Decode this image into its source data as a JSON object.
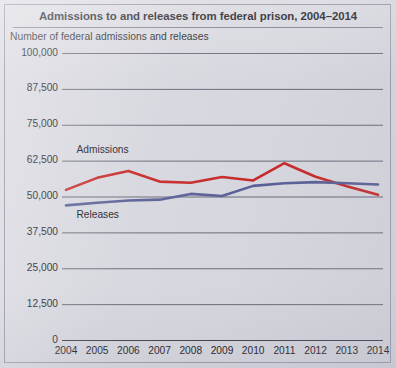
{
  "figure": {
    "title": "Admissions to and releases from federal prison, 2004–2014",
    "axis_title": "Number of federal admissions and releases",
    "background_color": "#d6d6de",
    "border_color": "#9a9aaa"
  },
  "chart_data": {
    "type": "line",
    "title": "Admissions to and releases from federal prison, 2004–2014",
    "subtitle": "Number of federal admissions and releases",
    "xlabel": "",
    "ylabel": "Number of federal admissions and releases",
    "categories": [
      "2004",
      "2005",
      "2006",
      "2007",
      "2008",
      "2009",
      "2010",
      "2011",
      "2012",
      "2013",
      "2014"
    ],
    "x": [
      2004,
      2005,
      2006,
      2007,
      2008,
      2009,
      2010,
      2011,
      2012,
      2013,
      2014
    ],
    "ylim": [
      0,
      100000
    ],
    "yticks": [
      0,
      12500,
      25000,
      37500,
      50000,
      62500,
      75000,
      87500,
      100000
    ],
    "ytick_labels": [
      "0",
      "12,500",
      "25,000",
      "37,500",
      "50,000",
      "62,500",
      "75,000",
      "87,500",
      "100,000"
    ],
    "grid": true,
    "grid_axis": "y",
    "legend": "inline-labels",
    "series": [
      {
        "name": "Admissions",
        "color": "#c62a28",
        "values": [
          52300,
          56500,
          58900,
          55200,
          54800,
          56800,
          55600,
          61600,
          56900,
          53600,
          50600
        ]
      },
      {
        "name": "Releases",
        "color": "#5a5f96",
        "values": [
          46900,
          47800,
          48600,
          48900,
          50900,
          50200,
          53700,
          54600,
          55000,
          54600,
          54200
        ]
      }
    ],
    "annotations": [
      {
        "text": "Admissions",
        "x": 2004.4,
        "y": 66000
      },
      {
        "text": "Releases",
        "x": 2004.4,
        "y": 43500
      }
    ]
  }
}
